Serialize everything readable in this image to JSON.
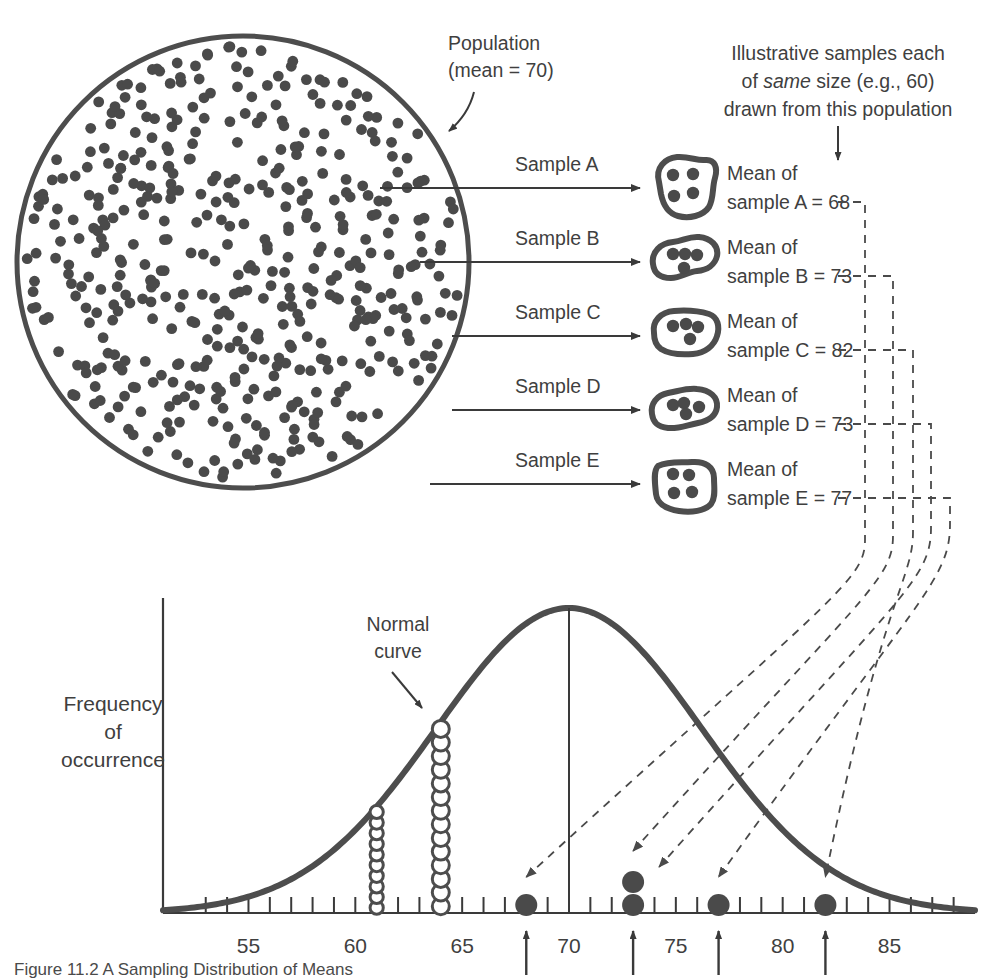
{
  "figure": {
    "caption": "Figure 11.2  A Sampling Distribution of Means",
    "population_label_line1": "Population",
    "population_label_line2": "(mean = 70)",
    "illustrative_line1": "Illustrative samples each",
    "illustrative_line2_pre": "of ",
    "illustrative_line2_em": "same",
    "illustrative_line2_post": " size (e.g., 60)",
    "illustrative_line3": "drawn from this population",
    "normal_curve_line1": "Normal",
    "normal_curve_line2": "curve",
    "y_axis_line1": "Frequency",
    "y_axis_line2": "of",
    "y_axis_line3": "occurrence",
    "population_mean": 70
  },
  "samples": [
    {
      "arrow_label": "Sample A",
      "mean_line1": "Mean of",
      "mean_line2": "sample A = 68",
      "letter": "A",
      "mean": 68,
      "dots_in_blob": 4
    },
    {
      "arrow_label": "Sample B",
      "mean_line1": "Mean of",
      "mean_line2": "sample B = 73",
      "letter": "B",
      "mean": 73,
      "dots_in_blob": 4
    },
    {
      "arrow_label": "Sample C",
      "mean_line1": "Mean of",
      "mean_line2": "sample C = 82",
      "letter": "C",
      "mean": 82,
      "dots_in_blob": 4
    },
    {
      "arrow_label": "Sample D",
      "mean_line1": "Mean of",
      "mean_line2": "sample D = 73",
      "letter": "D",
      "mean": 73,
      "dots_in_blob": 4
    },
    {
      "arrow_label": "Sample E",
      "mean_line1": "Mean of",
      "mean_line2": "sample E = 77",
      "letter": "E",
      "mean": 77,
      "dots_in_blob": 4
    }
  ],
  "chart_data": {
    "type": "line",
    "title": "Sampling Distribution of Means",
    "xlabel": "",
    "ylabel": "Frequency of occurrence",
    "xlim": [
      51,
      89
    ],
    "tick_labels": [
      55,
      60,
      65,
      70,
      75,
      80,
      85
    ],
    "tick_interval": 1,
    "grid": false,
    "legend": null,
    "curve": {
      "kind": "normal",
      "mean": 70,
      "sd": 6.2,
      "note": "Normal curve"
    },
    "center_line_x": 70,
    "open_circle_stacks": [
      {
        "x": 61,
        "count": 10
      },
      {
        "x": 64,
        "count": 14
      }
    ],
    "filled_sample_dots": [
      {
        "x": 68,
        "count": 1
      },
      {
        "x": 73,
        "count": 2
      },
      {
        "x": 77,
        "count": 1
      },
      {
        "x": 82,
        "count": 1
      }
    ],
    "arrow_markers_x": [
      68,
      73,
      77,
      82
    ]
  },
  "colors": {
    "ink": "#3f3f3f",
    "curve": "#4d4d4d",
    "dot_fill": "#4a4a4a",
    "axis": "#3a3a3a",
    "dashed": "#555555",
    "background": "#ffffff"
  }
}
